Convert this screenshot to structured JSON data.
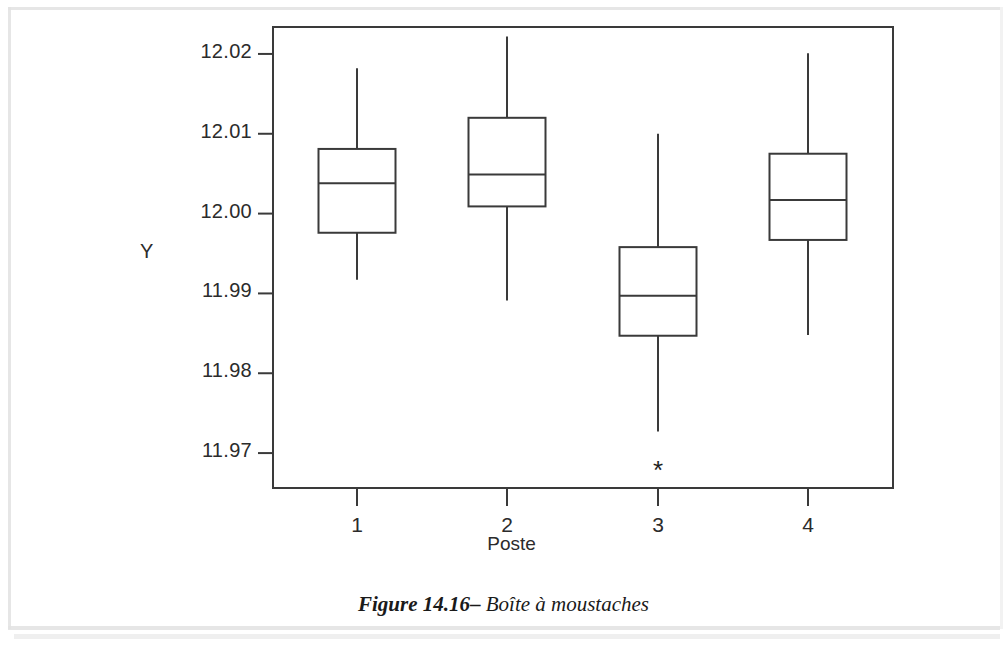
{
  "caption": {
    "label": "Figure 14.16",
    "dash": "–",
    "text": "Boîte à moustaches"
  },
  "chart_data": {
    "type": "box",
    "title": "",
    "xlabel": "Poste",
    "ylabel": "Y",
    "categories": [
      "1",
      "2",
      "3",
      "4"
    ],
    "ylim": [
      11.9655,
      12.0235
    ],
    "yticks": [
      11.97,
      11.98,
      11.99,
      12.0,
      12.01,
      12.02
    ],
    "ytick_labels": [
      "11.97",
      "11.98",
      "11.99",
      "12.00",
      "12.01",
      "12.02"
    ],
    "grid": false,
    "legend": null,
    "axis_color": "#3a3a3a",
    "box_color": "#3a3a3a",
    "boxes": [
      {
        "category": "1",
        "whisker_low": 11.9917,
        "q1": 11.9976,
        "median": 12.0038,
        "q3": 12.0081,
        "whisker_high": 12.0182,
        "outliers": []
      },
      {
        "category": "2",
        "whisker_low": 11.9891,
        "q1": 12.0009,
        "median": 12.0049,
        "q3": 12.012,
        "whisker_high": 12.0222,
        "outliers": []
      },
      {
        "category": "3",
        "whisker_low": 11.9727,
        "q1": 11.9847,
        "median": 11.9897,
        "q3": 11.9958,
        "whisker_high": 12.01,
        "outliers": [
          11.9679
        ]
      },
      {
        "category": "4",
        "whisker_low": 11.9848,
        "q1": 11.9967,
        "median": 12.0017,
        "q3": 12.0075,
        "whisker_high": 12.0201,
        "outliers": []
      }
    ],
    "outlier_marker": "*"
  }
}
